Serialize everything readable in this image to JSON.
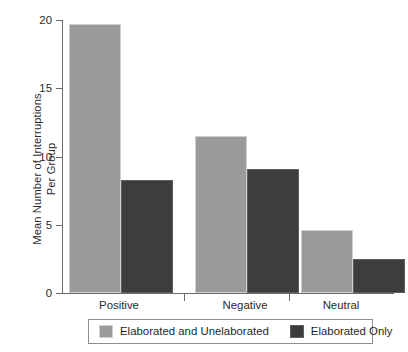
{
  "chart_data": {
    "type": "bar",
    "title": "",
    "subtitle": "",
    "xlabel": "",
    "ylabel_lines": [
      "Mean Number of Interruptions",
      "Per Group"
    ],
    "ylabel": "Mean Number of Interruptions Per Group",
    "categories": [
      "Positive",
      "Negative",
      "Neutral"
    ],
    "series": [
      {
        "name": "Elaborated and Unelaborated",
        "color": "#9a9a9a",
        "values": [
          19.7,
          11.5,
          4.6
        ]
      },
      {
        "name": "Elaborated Only",
        "color": "#3d3d3d",
        "values": [
          8.3,
          9.1,
          2.5
        ]
      }
    ],
    "ylim": [
      0,
      20
    ],
    "yticks": [
      0,
      5,
      10,
      15,
      20
    ],
    "ytick_labels": [
      "0",
      "5",
      "10",
      "15",
      "20"
    ],
    "grid": false,
    "legend_position": "bottom",
    "axis_color": "#6a6a6a",
    "background": "#ffffff"
  },
  "legend": {
    "entries": [
      {
        "label": "Elaborated and Unelaborated",
        "swatch": "light-gray-swatch-icon"
      },
      {
        "label": "Elaborated Only",
        "swatch": "dark-gray-swatch-icon"
      }
    ]
  }
}
